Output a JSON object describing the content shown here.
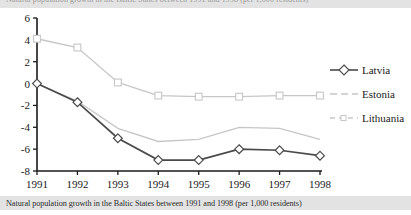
{
  "top_band": {
    "text": "Natural population growth in the Baltic States between 1991 and 1998 (per 1,000 residents)"
  },
  "caption": {
    "text": "Natural population growth in the Baltic States between 1991 and 1998 (per 1,000 residents)"
  },
  "legend": {
    "position": "right",
    "items": [
      {
        "label": "Latvia",
        "color": "#4a4a4a",
        "style": "solid",
        "marker": "diamond"
      },
      {
        "label": "Estonia",
        "color": "#c6c6c6",
        "style": "dashed",
        "marker": "none"
      },
      {
        "label": "Lithuania",
        "color": "#c6c6c6",
        "style": "dashed",
        "marker": "none"
      }
    ]
  },
  "chart_data": {
    "type": "line",
    "title": "",
    "subtitle": "",
    "xlabel": "",
    "ylabel": "",
    "categories": [
      "1991",
      "1992",
      "1993",
      "1994",
      "1995",
      "1996",
      "1997",
      "1998"
    ],
    "x": [
      1991,
      1992,
      1993,
      1994,
      1995,
      1996,
      1997,
      1998
    ],
    "ylim": [
      -8,
      6
    ],
    "yticks": [
      6,
      4,
      2,
      0,
      -2,
      -4,
      -6,
      -8
    ],
    "ytick_labels": [
      "6",
      "4",
      "2",
      "0",
      "-2",
      "-4",
      "-6",
      "-8"
    ],
    "xtick_labels": [
      "1991",
      "1992",
      "1993",
      "1994",
      "1995",
      "1996",
      "1997",
      "1998"
    ],
    "grid": false,
    "legend_position": "right",
    "series": [
      {
        "name": "Latvia",
        "color": "#4a4a4a",
        "style": "solid",
        "marker": "diamond",
        "values": [
          0.0,
          -1.7,
          -5.0,
          -7.0,
          -7.0,
          -6.0,
          -6.1,
          -6.6
        ]
      },
      {
        "name": "Estonia",
        "color": "#c6c6c6",
        "style": "dashed",
        "marker": "none",
        "values": [
          0.0,
          -1.6,
          -4.1,
          -5.3,
          -5.1,
          -4.0,
          -4.1,
          -5.1
        ]
      },
      {
        "name": "Lithuania",
        "color": "#c6c6c6",
        "style": "dashed",
        "marker": "square",
        "values": [
          4.1,
          3.3,
          0.1,
          -1.1,
          -1.2,
          -1.2,
          -1.1,
          -1.1
        ]
      }
    ]
  },
  "colors": {
    "band_background": "#e3e3e3",
    "axis": "#1a1a1a",
    "latvia": "#4a4a4a",
    "estonia": "#c6c6c6",
    "lithuania": "#c6c6c6"
  }
}
